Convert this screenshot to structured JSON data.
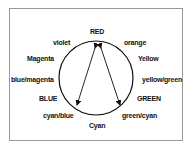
{
  "diagram": {
    "labels": {
      "red": "RED",
      "orange": "orange",
      "yellow": "Yellow",
      "yellow_green": "yellow/green",
      "green": "GREEN",
      "green_cyan": "green/cyan",
      "cyan": "Cyan",
      "cyan_blue": "cyan/blue",
      "blue": "BLUE",
      "blue_magenta": "blue/magenta",
      "magenta": "Magenta",
      "violet": "violet"
    },
    "arrows": [
      {
        "from": "RED",
        "to": "cyan/blue"
      },
      {
        "from": "RED",
        "to": "green/cyan"
      }
    ],
    "colors": {
      "stroke": "#111111",
      "frame": "#9a9a9a",
      "background": "#ffffff"
    }
  }
}
